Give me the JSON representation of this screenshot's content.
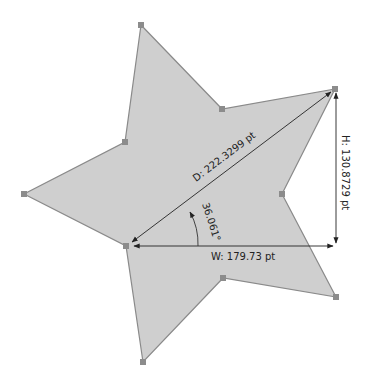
{
  "shape": {
    "type": "star",
    "fill": "#cfcfcf",
    "stroke": "#8a8a8a",
    "handle_color": "#8c8c8c",
    "points": "141,25 222,109 335,89 282,194 336,297 223,278 143,362 126,246 24,194 125,142"
  },
  "measurements": {
    "diagonal_label": "D: 222.3299 pt",
    "height_label": "H: 130.8729 pt",
    "width_label": "W: 179.73 pt",
    "angle_label": "36.061°"
  }
}
